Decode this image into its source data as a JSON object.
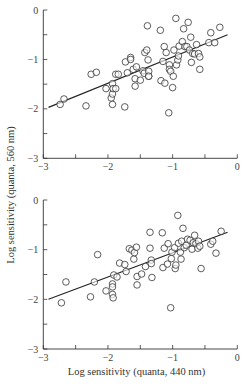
{
  "figure": {
    "ylabel": "Log sensitivity (quanta, 560 nm)",
    "xlabel": "Log sensitivity (quanta, 440 nm)"
  },
  "chart_data": [
    {
      "type": "scatter",
      "title": "",
      "xlabel": "",
      "ylabel": "Log sensitivity (quanta, 560 nm)",
      "xlim": [
        -3,
        0
      ],
      "ylim": [
        -3,
        0
      ],
      "xticks": [
        -3,
        -2,
        -1,
        0
      ],
      "yticks": [
        0,
        -1,
        -2,
        -3
      ],
      "grid": false,
      "fit_line": {
        "x": [
          -2.92,
          -0.15
        ],
        "y": [
          -1.97,
          -0.5
        ]
      },
      "points": [
        [
          -2.74,
          -1.91
        ],
        [
          -2.68,
          -1.8
        ],
        [
          -2.34,
          -1.94
        ],
        [
          -2.26,
          -1.3
        ],
        [
          -2.18,
          -1.26
        ],
        [
          -2.03,
          -1.59
        ],
        [
          -1.95,
          -1.78
        ],
        [
          -1.93,
          -1.49
        ],
        [
          -1.93,
          -1.7
        ],
        [
          -1.93,
          -1.91
        ],
        [
          -1.92,
          -1.59
        ],
        [
          -1.88,
          -1.3
        ],
        [
          -1.84,
          -1.3
        ],
        [
          -1.88,
          -1.59
        ],
        [
          -1.74,
          -1.96
        ],
        [
          -1.73,
          -1.05
        ],
        [
          -1.7,
          -1.27
        ],
        [
          -1.65,
          -0.96
        ],
        [
          -1.65,
          -1.0
        ],
        [
          -1.61,
          -1.2
        ],
        [
          -1.58,
          -1.39
        ],
        [
          -1.58,
          -1.54
        ],
        [
          -1.56,
          -1.15
        ],
        [
          -1.5,
          -1.42
        ],
        [
          -1.46,
          -1.23
        ],
        [
          -1.44,
          -1.28
        ],
        [
          -1.43,
          -0.86
        ],
        [
          -1.4,
          -0.81
        ],
        [
          -1.38,
          -1.01
        ],
        [
          -1.37,
          -1.34
        ],
        [
          -1.39,
          -0.32
        ],
        [
          -1.37,
          -1.24
        ],
        [
          -1.37,
          -1.34
        ],
        [
          -1.19,
          -0.41
        ],
        [
          -1.18,
          -1.43
        ],
        [
          -1.15,
          -1.04
        ],
        [
          -1.13,
          -0.74
        ],
        [
          -1.12,
          -1.48
        ],
        [
          -1.1,
          -0.86
        ],
        [
          -1.06,
          -2.08
        ],
        [
          -1.05,
          -1.11
        ],
        [
          -1.05,
          -1.2
        ],
        [
          -1.03,
          -1.24
        ],
        [
          -1.0,
          -1.57
        ],
        [
          -0.99,
          -1.34
        ],
        [
          -0.98,
          -0.81
        ],
        [
          -0.95,
          -0.17
        ],
        [
          -0.94,
          -1.11
        ],
        [
          -0.92,
          -1.01
        ],
        [
          -0.91,
          -0.93
        ],
        [
          -0.9,
          -0.73
        ],
        [
          -0.85,
          -0.64
        ],
        [
          -0.83,
          -0.38
        ],
        [
          -0.81,
          -0.74
        ],
        [
          -0.78,
          -0.74
        ],
        [
          -0.76,
          -0.25
        ],
        [
          -0.74,
          -0.81
        ],
        [
          -0.72,
          -0.55
        ],
        [
          -0.71,
          -1.06
        ],
        [
          -0.69,
          -0.88
        ],
        [
          -0.66,
          -0.89
        ],
        [
          -0.63,
          -0.7
        ],
        [
          -0.6,
          -0.88
        ],
        [
          -0.58,
          -1.2
        ],
        [
          -0.58,
          -0.95
        ],
        [
          -0.41,
          -0.46
        ],
        [
          -0.44,
          -0.66
        ],
        [
          -0.35,
          -0.66
        ],
        [
          -0.27,
          -0.35
        ]
      ]
    },
    {
      "type": "scatter",
      "title": "",
      "xlabel": "Log sensitivity (quanta, 440 nm)",
      "ylabel": "Log sensitivity (quanta, 560 nm)",
      "xlim": [
        -3,
        0
      ],
      "ylim": [
        -3,
        0
      ],
      "xticks": [
        -3,
        -2,
        -1,
        0
      ],
      "yticks": [
        0,
        -1,
        -2,
        -3
      ],
      "grid": false,
      "fit_line": {
        "x": [
          -2.92,
          -0.15
        ],
        "y": [
          -2.0,
          -0.65
        ]
      },
      "points": [
        [
          -2.72,
          -2.07
        ],
        [
          -2.65,
          -1.65
        ],
        [
          -2.27,
          -1.95
        ],
        [
          -2.21,
          -1.65
        ],
        [
          -2.16,
          -1.1
        ],
        [
          -2.03,
          -1.83
        ],
        [
          -1.93,
          -1.69
        ],
        [
          -1.93,
          -1.75
        ],
        [
          -1.93,
          -1.9
        ],
        [
          -1.92,
          -1.97
        ],
        [
          -1.91,
          -1.51
        ],
        [
          -1.86,
          -1.55
        ],
        [
          -1.82,
          -1.27
        ],
        [
          -1.74,
          -1.3
        ],
        [
          -1.72,
          -1.44
        ],
        [
          -1.67,
          -0.98
        ],
        [
          -1.63,
          -1.01
        ],
        [
          -1.6,
          -1.19
        ],
        [
          -1.59,
          -1.06
        ],
        [
          -1.56,
          -0.95
        ],
        [
          -1.55,
          -1.54
        ],
        [
          -1.55,
          -1.71
        ],
        [
          -1.48,
          -1.49
        ],
        [
          -1.42,
          -1.34
        ],
        [
          -1.35,
          -0.65
        ],
        [
          -1.35,
          -0.97
        ],
        [
          -1.33,
          -1.21
        ],
        [
          -1.33,
          -1.28
        ],
        [
          -1.32,
          -1.56
        ],
        [
          -1.16,
          -0.66
        ],
        [
          -1.15,
          -1.36
        ],
        [
          -1.13,
          -0.97
        ],
        [
          -1.08,
          -1.29
        ],
        [
          -1.07,
          -0.88
        ],
        [
          -1.03,
          -2.17
        ],
        [
          -1.02,
          -1.18
        ],
        [
          -1.01,
          -1.05
        ],
        [
          -0.97,
          -0.96
        ],
        [
          -0.96,
          -1.38
        ],
        [
          -0.95,
          -1.31
        ],
        [
          -0.92,
          -0.31
        ],
        [
          -0.91,
          -0.87
        ],
        [
          -0.88,
          -1.05
        ],
        [
          -0.87,
          -1.19
        ],
        [
          -0.86,
          -0.83
        ],
        [
          -0.84,
          -0.57
        ],
        [
          -0.82,
          -0.96
        ],
        [
          -0.79,
          -0.91
        ],
        [
          -0.77,
          -0.79
        ],
        [
          -0.73,
          -0.81
        ],
        [
          -0.7,
          -0.99
        ],
        [
          -0.68,
          -0.86
        ],
        [
          -0.66,
          -0.71
        ],
        [
          -0.64,
          -0.88
        ],
        [
          -0.61,
          -0.97
        ],
        [
          -0.6,
          -0.83
        ],
        [
          -0.58,
          -0.93
        ],
        [
          -0.56,
          -1.38
        ],
        [
          -0.41,
          -0.89
        ],
        [
          -0.38,
          -0.83
        ],
        [
          -0.33,
          -1.07
        ],
        [
          -0.25,
          -0.63
        ]
      ]
    }
  ]
}
